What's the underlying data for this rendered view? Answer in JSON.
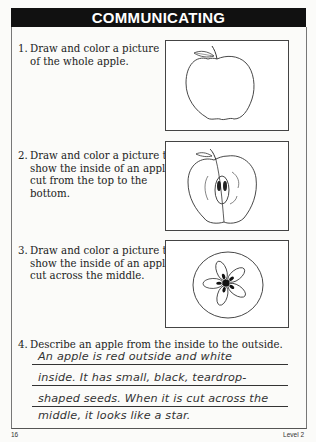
{
  "header": {
    "title": "COMMUNICATING"
  },
  "questions": [
    {
      "number": "1.",
      "lines": [
        "Draw and color a picture",
        "of the whole apple."
      ],
      "picture": "whole-apple"
    },
    {
      "number": "2.",
      "lines": [
        "Draw and color a picture to",
        "show the inside of an apple",
        "cut from the top to the",
        "bottom."
      ],
      "picture": "apple-cut-top-to-bottom"
    },
    {
      "number": "3.",
      "lines": [
        "Draw and color a picture to",
        "show the inside of an apple",
        "cut across the middle."
      ],
      "picture": "apple-cut-across-middle"
    },
    {
      "number": "4.",
      "lines": [
        "Describe an apple from the inside to the outside."
      ]
    }
  ],
  "answer": {
    "lines": [
      "An apple is red outside and white",
      "inside. It has small, black, teardrop-",
      "shaped seeds. When it is cut across the",
      "middle, it looks like a star."
    ]
  },
  "footer": {
    "page_number": "16",
    "level": "Level 2"
  },
  "colors": {
    "header_bg": "#111111",
    "header_text": "#ffffff",
    "ink": "#222222"
  }
}
